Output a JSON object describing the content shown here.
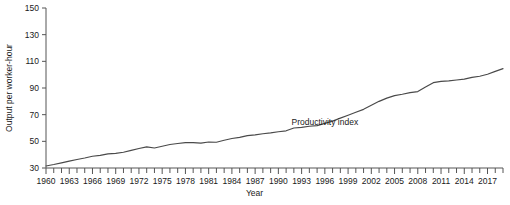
{
  "chart_data": {
    "type": "line",
    "title": "",
    "xlabel": "Year",
    "ylabel": "Output per worker-hour",
    "xlim": [
      1960,
      2019
    ],
    "ylim": [
      30,
      150
    ],
    "yticks": [
      30,
      50,
      70,
      90,
      110,
      130,
      150
    ],
    "xticks": [
      1960,
      1963,
      1966,
      1969,
      1972,
      1975,
      1978,
      1981,
      1984,
      1987,
      1990,
      1993,
      1996,
      1999,
      2002,
      2005,
      2008,
      2011,
      2014,
      2017
    ],
    "xtick_step_minor": 1,
    "grid": false,
    "legend": "none",
    "annotations": [
      {
        "text": "Productivity index",
        "x": 1996,
        "y": 62
      }
    ],
    "series": [
      {
        "name": "Productivity index",
        "color": "#4a4a4a",
        "x": [
          1960,
          1961,
          1962,
          1963,
          1964,
          1965,
          1966,
          1967,
          1968,
          1969,
          1970,
          1971,
          1972,
          1973,
          1974,
          1975,
          1976,
          1977,
          1978,
          1979,
          1980,
          1981,
          1982,
          1983,
          1984,
          1985,
          1986,
          1987,
          1988,
          1989,
          1990,
          1991,
          1992,
          1993,
          1994,
          1995,
          1996,
          1997,
          1998,
          1999,
          2000,
          2001,
          2002,
          2003,
          2004,
          2005,
          2006,
          2007,
          2008,
          2009,
          2010,
          2011,
          2012,
          2013,
          2014,
          2015,
          2016,
          2017,
          2018,
          2019
        ],
        "y": [
          31.5,
          32.6,
          33.9,
          35.1,
          36.4,
          37.5,
          38.8,
          39.5,
          40.6,
          41.0,
          41.8,
          43.2,
          44.6,
          45.8,
          45.0,
          46.3,
          47.6,
          48.4,
          49.1,
          49.0,
          48.7,
          49.5,
          49.3,
          50.8,
          52.1,
          53.0,
          54.3,
          54.8,
          55.7,
          56.3,
          57.2,
          57.9,
          60.0,
          60.5,
          61.3,
          61.8,
          63.5,
          65.2,
          67.4,
          69.6,
          71.8,
          74.0,
          77.0,
          80.0,
          82.4,
          84.3,
          85.3,
          86.5,
          87.3,
          90.7,
          94.0,
          95.0,
          95.3,
          96.0,
          96.7,
          98.0,
          98.8,
          100.3,
          102.5,
          104.5
        ]
      }
    ]
  },
  "axis": {
    "y_title": "Output per worker-hour",
    "x_title": "Year"
  }
}
